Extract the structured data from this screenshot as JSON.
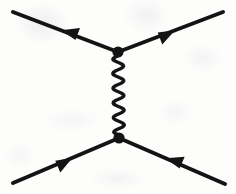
{
  "figure": {
    "kind": "feynman-diagram",
    "title": "",
    "caption": "",
    "background_color": "#fdfdfc",
    "ink_color": "#141414",
    "canvas": {
      "width": 236,
      "height": 194
    }
  },
  "chart_data": {
    "type": "diagram",
    "title": "",
    "xlabel": "",
    "ylabel": "",
    "xlim": [
      0,
      236
    ],
    "ylim": [
      0,
      194
    ],
    "grid": false,
    "legend": "none",
    "nodes": [
      {
        "id": "vertex-top",
        "label": "",
        "x": 118,
        "y": 52,
        "radius": 5.6,
        "style": "filled-dot"
      },
      {
        "id": "vertex-bottom",
        "label": "",
        "x": 119,
        "y": 138,
        "radius": 5.6,
        "style": "filled-dot"
      }
    ],
    "edges": [
      {
        "id": "incoming-upper-left",
        "label": "",
        "style": "straight-fermion",
        "from": {
          "x": 118,
          "y": 52
        },
        "to": {
          "x": 13,
          "y": 12
        },
        "stroke_width": 4.0,
        "arrow": {
          "position": 0.46,
          "direction": "toward-to",
          "size": 17
        }
      },
      {
        "id": "outgoing-upper-right",
        "label": "",
        "style": "straight-fermion",
        "from": {
          "x": 118,
          "y": 52
        },
        "to": {
          "x": 223,
          "y": 12
        },
        "stroke_width": 4.0,
        "arrow": {
          "position": 0.46,
          "direction": "toward-to",
          "size": 17
        }
      },
      {
        "id": "incoming-lower-left",
        "label": "",
        "style": "straight-fermion",
        "from": {
          "x": 13,
          "y": 183
        },
        "to": {
          "x": 119,
          "y": 138
        },
        "stroke_width": 4.0,
        "arrow": {
          "position": 0.48,
          "direction": "toward-to",
          "size": 17
        }
      },
      {
        "id": "incoming-lower-right",
        "label": "",
        "style": "straight-fermion",
        "from": {
          "x": 225,
          "y": 184
        },
        "to": {
          "x": 119,
          "y": 138
        },
        "stroke_width": 4.0,
        "arrow": {
          "position": 0.48,
          "direction": "toward-to",
          "size": 17
        }
      },
      {
        "id": "boson-propagator",
        "label": "",
        "style": "wavy-boson",
        "from": {
          "x": 118,
          "y": 55
        },
        "to": {
          "x": 119,
          "y": 136
        },
        "stroke_width": 3.4,
        "wave": {
          "amplitude": 5.4,
          "cycles": 5.5
        },
        "arrow": null
      }
    ],
    "annotations": []
  }
}
